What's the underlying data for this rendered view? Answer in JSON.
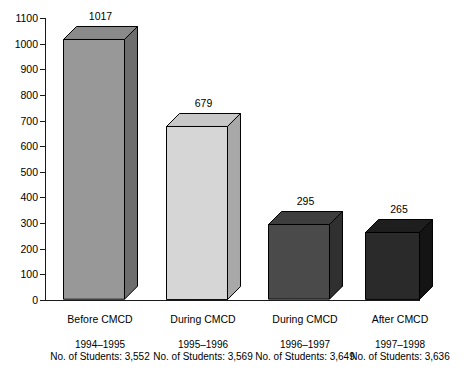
{
  "chart_data": {
    "type": "bar",
    "title": "",
    "subtitle": "",
    "xlabel": "",
    "ylabel": "",
    "grid": false,
    "legend": "none",
    "three_d": true,
    "categories": [
      "Before CMCD",
      "During CMCD",
      "During CMCD",
      "After CMCD"
    ],
    "values": [
      1017,
      679,
      295,
      265
    ],
    "value_labels": [
      "1017",
      "679",
      "295",
      "265"
    ],
    "ylim": [
      0,
      1100
    ],
    "ytick_step": 100,
    "yticks": [
      0,
      100,
      200,
      300,
      400,
      500,
      600,
      700,
      800,
      900,
      1000,
      1100
    ],
    "ytick_labels": [
      "0",
      "100",
      "200",
      "300",
      "400",
      "500",
      "600",
      "700",
      "800",
      "900",
      "1000",
      "1100"
    ],
    "bar_colors": [
      "#989898",
      "#d6d6d6",
      "#4a4a4a",
      "#2a2a2a"
    ],
    "bar_top_colors": [
      "#8a8a8a",
      "#c8c8c8",
      "#3e3e3e",
      "#1e1e1e"
    ],
    "bar_side_colors": [
      "#6e6e6e",
      "#a8a8a8",
      "#303030",
      "#141414"
    ],
    "annotations": [
      {
        "category": "Before CMCD",
        "years": "1994–1995",
        "students": "No. of Students: 3,552"
      },
      {
        "category": "During CMCD",
        "years": "1995–1996",
        "students": "No. of Students: 3,569"
      },
      {
        "category": "During CMCD",
        "years": "1996–1997",
        "students": "No. of Students: 3,649"
      },
      {
        "category": "After CMCD",
        "years": "1997–1998",
        "students": "No. of Students: 3,636"
      }
    ]
  }
}
